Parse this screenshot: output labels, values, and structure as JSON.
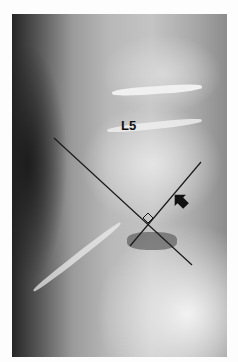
{
  "figure": {
    "vertebra_label": "L5",
    "annotations": {
      "line_1": {
        "x1": 54,
        "y1": 138,
        "x2": 192,
        "y2": 265
      },
      "line_2": {
        "x1": 130,
        "y1": 246,
        "x2": 201,
        "y2": 162
      },
      "right_angle_marker": {
        "x": 148,
        "y": 222
      },
      "arrow": {
        "x": 185,
        "y": 205,
        "direction": "up-left"
      }
    },
    "colors": {
      "line": "#1a1a1a",
      "background": "#fdfdfd"
    }
  }
}
